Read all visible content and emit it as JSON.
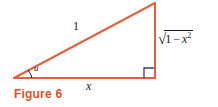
{
  "figure": {
    "caption": "Figure 6",
    "caption_color": "#d9512c",
    "line_color": "#e06141",
    "background_color": "#ffffff",
    "marker_color": "#3b3b6d"
  },
  "diagram": {
    "type": "right-triangle",
    "vertices": {
      "bottom_left": {
        "x": 14,
        "y": 78
      },
      "bottom_right": {
        "x": 155,
        "y": 78
      },
      "apex": {
        "x": 155,
        "y": 3
      }
    },
    "labels": {
      "hypotenuse": "1",
      "base": "x",
      "angle": "u",
      "vertical_radical_sign": "√",
      "vertical_radicand_one": "1",
      "vertical_radicand_minus": "−",
      "vertical_radicand_var": "x",
      "vertical_radicand_exponent": "2",
      "vertical_full": "√(1 − x²)"
    },
    "right_angle_marker": "right-angle-square",
    "angle_arc_marker": "angle-arc"
  }
}
